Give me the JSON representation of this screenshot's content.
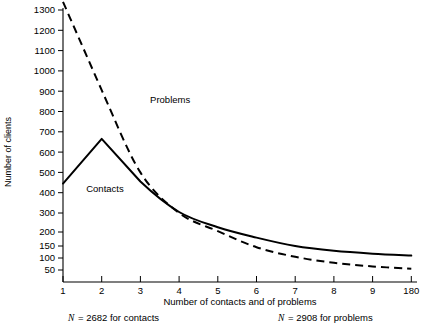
{
  "chart_data": {
    "type": "line",
    "title": "",
    "xlabel": "Number of contacts and of problems",
    "ylabel": "Number of clients",
    "x_tick_labels": [
      "1",
      "2",
      "3",
      "4",
      "5",
      "6",
      "7",
      "8",
      "9",
      "180"
    ],
    "y_tick_labels": [
      "50",
      "100",
      "150",
      "200",
      "300",
      "400",
      "500",
      "600",
      "700",
      "800",
      "900",
      "1000",
      "1100",
      "1200",
      "1300"
    ],
    "y_tick_values": [
      50,
      100,
      150,
      200,
      300,
      400,
      500,
      600,
      700,
      800,
      900,
      1000,
      1100,
      1200,
      1300
    ],
    "ylim": [
      0,
      1340
    ],
    "grid": false,
    "legend_position": "inline-annotations",
    "categories": [
      1,
      2,
      3,
      4,
      5,
      6,
      7,
      8,
      9,
      10
    ],
    "series": [
      {
        "name": "Contacts",
        "style": "solid",
        "color": "#000000",
        "values": [
          445,
          665,
          455,
          305,
          225,
          180,
          150,
          130,
          118,
          110
        ]
      },
      {
        "name": "Problems",
        "style": "dashed",
        "color": "#000000",
        "values": [
          1340,
          905,
          500,
          300,
          205,
          145,
          105,
          80,
          65,
          55
        ]
      }
    ],
    "annotations": [
      {
        "text": "Problems",
        "x": 3.25,
        "y": 840
      },
      {
        "text": "Contacts",
        "x": 1.6,
        "y": 405
      }
    ],
    "notes": [
      {
        "symbol": "N",
        "text": "= 2682 for contacts"
      },
      {
        "symbol": "N",
        "text": "= 2908 for problems"
      }
    ]
  }
}
